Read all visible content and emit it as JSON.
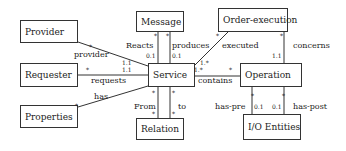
{
  "diagram": {
    "type": "UML class diagram",
    "classes": [
      {
        "id": "provider",
        "label": "Provider"
      },
      {
        "id": "requester",
        "label": "Requester"
      },
      {
        "id": "properties",
        "label": "Properties"
      },
      {
        "id": "message",
        "label": "Message"
      },
      {
        "id": "service",
        "label": "Service"
      },
      {
        "id": "relation",
        "label": "Relation"
      },
      {
        "id": "order_execution",
        "label": "Order-execution"
      },
      {
        "id": "operation",
        "label": "Operation"
      },
      {
        "id": "io_entities",
        "label": "I/O Entities"
      }
    ],
    "associations": [
      {
        "from": "provider",
        "to": "service",
        "label": "provider",
        "mult_from": "*",
        "mult_to": "1.1"
      },
      {
        "from": "requester",
        "to": "service",
        "label": "requests",
        "mult_from": "*",
        "mult_to": "1.1"
      },
      {
        "from": "properties",
        "to": "service",
        "label": "has",
        "mult_from": "*",
        "mult_to": ""
      },
      {
        "from": "message",
        "to": "service",
        "label": "Reacts",
        "mult_from": "*",
        "mult_to": "0.1"
      },
      {
        "from": "message",
        "to": "service",
        "label": "produces",
        "mult_from": "*",
        "mult_to": "0.1"
      },
      {
        "from": "service",
        "to": "relation",
        "label": "From",
        "mult_from": "*",
        "mult_to": "*"
      },
      {
        "from": "service",
        "to": "relation",
        "label": "to",
        "mult_from": "*",
        "mult_to": "*"
      },
      {
        "from": "order_execution",
        "to": "service",
        "label": "executed",
        "mult_from": "*",
        "mult_to": "1.*"
      },
      {
        "from": "order_execution",
        "to": "operation",
        "label": "concerns",
        "mult_from": "*",
        "mult_to": "1.1"
      },
      {
        "from": "service",
        "to": "operation",
        "label": "contains",
        "mult_from": "1.*",
        "mult_to": "*"
      },
      {
        "from": "operation",
        "to": "io_entities",
        "label": "has-pre",
        "mult_from": "*",
        "mult_to": "0.1"
      },
      {
        "from": "operation",
        "to": "io_entities",
        "label": "has-post",
        "mult_from": "*",
        "mult_to": "0.1"
      }
    ]
  }
}
